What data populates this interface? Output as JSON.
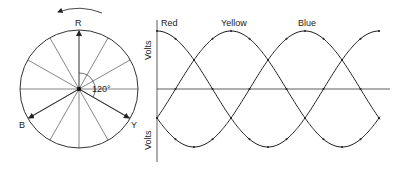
{
  "phasor": {
    "labels": {
      "red": "R",
      "yellow": "Y",
      "blue": "B"
    },
    "angle_label": "120°",
    "rotation": "counter-clockwise"
  },
  "waveform": {
    "curve_labels": {
      "red": "Red",
      "yellow": "Yellow",
      "blue": "Blue"
    },
    "axis_label_top": "Volts",
    "axis_label_bottom": "Volts"
  },
  "colors": {
    "line": "#222222",
    "background": "#ffffff"
  }
}
